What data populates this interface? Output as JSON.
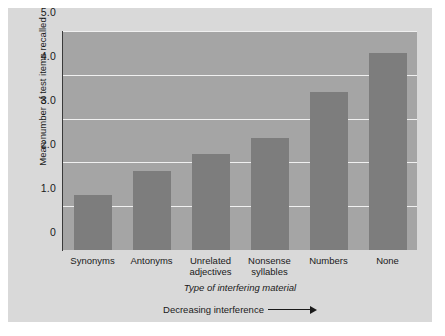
{
  "chart_data": {
    "type": "bar",
    "title": "",
    "categories": [
      "Synonyms",
      "Antonyms",
      "Unrelated adjectives",
      "Nonsense syllables",
      "Numbers",
      "None"
    ],
    "category_lines": [
      [
        "Synonyms"
      ],
      [
        "Antonyms"
      ],
      [
        "Unrelated",
        "adjectives"
      ],
      [
        "Nonsense",
        "syllables"
      ],
      [
        "Numbers"
      ],
      [
        "None"
      ]
    ],
    "values": [
      1.25,
      1.8,
      2.2,
      2.55,
      3.6,
      4.5
    ],
    "xlabel": "Type of interfering material",
    "ylabel": "Mean number of test items recalled",
    "ylim": [
      0,
      5.0
    ],
    "yticks": [
      "0",
      "1.0",
      "2.0",
      "3.0",
      "4.0",
      "5.0"
    ],
    "ytick_values": [
      0,
      1.0,
      2.0,
      3.0,
      4.0,
      5.0
    ],
    "grid": true,
    "legend": "none",
    "annotation": "Decreasing interference",
    "annotation_icon": "right-arrow-icon",
    "colors": {
      "bar": "#7d7d7d",
      "plot_background": "#a5a5a5",
      "figure_background": "#d9d9d9",
      "gridline": "#f0f0f0",
      "axis": "#3a3a3a",
      "text": "#1a1a1a"
    }
  }
}
